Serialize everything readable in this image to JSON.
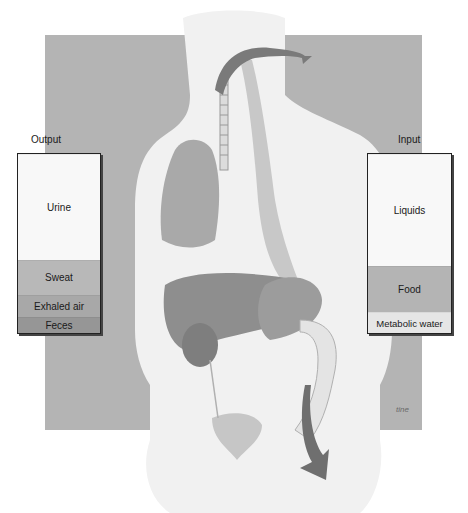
{
  "figure": {
    "colors": {
      "background_panel": "#b4b4b4",
      "body": "#f1f1f1",
      "organ_dark": "#8a8a8a",
      "arrow": "#6f6f6f"
    }
  },
  "output": {
    "title": "Output",
    "segments": [
      {
        "label": "Urine",
        "color": "#f8f8f8",
        "height": 107
      },
      {
        "label": "Sweat",
        "color": "#b8b8b8",
        "height": 34
      },
      {
        "label": "Exhaled air",
        "color": "#a8a8a8",
        "height": 22
      },
      {
        "label": "Feces",
        "color": "#969696",
        "height": 15
      }
    ]
  },
  "input": {
    "title": "Input",
    "segments": [
      {
        "label": "Liquids",
        "color": "#f8f8f8",
        "height": 112
      },
      {
        "label": "Food",
        "color": "#b4b4b4",
        "height": 46
      },
      {
        "label": "Metabolic water",
        "color": "#e6e6e6",
        "height": 20
      }
    ]
  },
  "signature": "tine"
}
